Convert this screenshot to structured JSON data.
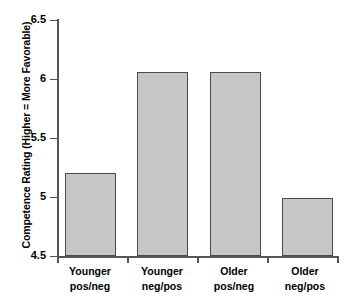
{
  "chart_data": {
    "type": "bar",
    "title": "",
    "xlabel": "",
    "ylabel": "Competence Rating (Higher = More Favorable)",
    "categories": [
      "Younger pos/neg",
      "Younger neg/pos",
      "Older pos/neg",
      "Older neg/pos"
    ],
    "category_lines": [
      {
        "line1": "Younger",
        "line2": "pos/neg"
      },
      {
        "line1": "Younger",
        "line2": "neg/pos"
      },
      {
        "line1": "Older",
        "line2": "pos/neg"
      },
      {
        "line1": "Older",
        "line2": "neg/pos"
      }
    ],
    "values": [
      5.2,
      6.06,
      6.06,
      4.99
    ],
    "ylim": [
      4.5,
      6.5
    ],
    "yticks": [
      "4.5",
      "5",
      "5.5",
      "6",
      "6.5"
    ],
    "ytick_values": [
      4.5,
      5,
      5.5,
      6,
      6.5
    ],
    "grid": false,
    "legend": false,
    "bar_fill_color": "#c6c6c6",
    "bar_edge_color": "#4a4a4a",
    "axis_color": "#555555",
    "background_color": "#ffffff"
  }
}
